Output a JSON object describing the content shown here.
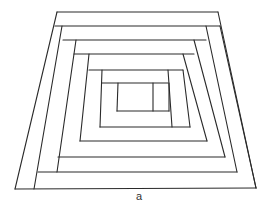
{
  "figure": {
    "caption": "a",
    "stroke_color": "#2a2a2a",
    "background": "#ffffff",
    "lines": [
      [
        57,
        12,
        218,
        12
      ],
      [
        218,
        12,
        256,
        188
      ],
      [
        15,
        189,
        256,
        188
      ],
      [
        57,
        12,
        15,
        189
      ],
      [
        55,
        26,
        220,
        26
      ],
      [
        62,
        26,
        34,
        189
      ],
      [
        220,
        26,
        256,
        188
      ],
      [
        206,
        26,
        237,
        172
      ],
      [
        38,
        172,
        237,
        172
      ],
      [
        63,
        40,
        206,
        40
      ],
      [
        76,
        40,
        57,
        172
      ],
      [
        194,
        40,
        225,
        157
      ],
      [
        58,
        157,
        225,
        157
      ],
      [
        74,
        54,
        194,
        54
      ],
      [
        89,
        54,
        80,
        141
      ],
      [
        183,
        54,
        207,
        141
      ],
      [
        80,
        141,
        207,
        141
      ],
      [
        89,
        70,
        183,
        70
      ],
      [
        102,
        70,
        100,
        127
      ],
      [
        168,
        70,
        172,
        127
      ],
      [
        100,
        127,
        190,
        127
      ],
      [
        183,
        70,
        190,
        127
      ],
      [
        102,
        83,
        168,
        83
      ],
      [
        118,
        83,
        117,
        111
      ],
      [
        153,
        83,
        153,
        111
      ],
      [
        117,
        111,
        169,
        111
      ],
      [
        169,
        83,
        169,
        111
      ]
    ]
  }
}
